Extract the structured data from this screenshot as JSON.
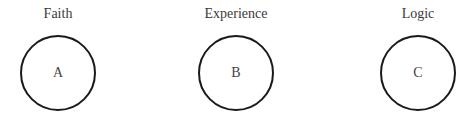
{
  "diagram": {
    "nodes": [
      {
        "title": "Faith",
        "letter": "A"
      },
      {
        "title": "Experience",
        "letter": "B"
      },
      {
        "title": "Logic",
        "letter": "C"
      }
    ]
  }
}
